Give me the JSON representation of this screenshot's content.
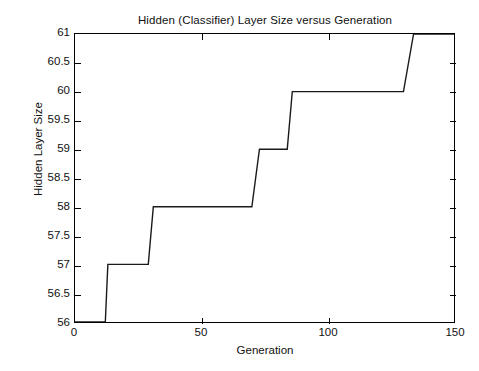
{
  "chart_data": {
    "type": "line",
    "title": "Hidden (Classifier) Layer Size versus Generation",
    "xlabel": "Generation",
    "ylabel": "Hidden Layer Size",
    "xlim": [
      0,
      150
    ],
    "ylim": [
      56,
      61
    ],
    "grid": false,
    "legend": null,
    "style": "step-like piecewise linear, single black series, no markers",
    "xticks": [
      0,
      50,
      100,
      150
    ],
    "xtick_labels": [
      "0",
      "50",
      "100",
      "150"
    ],
    "yticks": [
      56,
      56.5,
      57,
      57.5,
      58,
      58.5,
      59,
      59.5,
      60,
      60.5,
      61
    ],
    "ytick_labels": [
      "56",
      "56.5",
      "57",
      "57.5",
      "58",
      "58.5",
      "59",
      "59.5",
      "60",
      "60.5",
      "61"
    ],
    "series": [
      {
        "name": "Hidden Layer Size",
        "color": "#1a1a1a",
        "x": [
          12,
          13,
          29,
          31,
          70,
          73,
          84,
          86,
          130,
          134,
          150
        ],
        "y": [
          56,
          57,
          57,
          58,
          58,
          59,
          59,
          60,
          60,
          61,
          61
        ]
      }
    ],
    "steps": [
      {
        "generation_range": [
          0,
          12
        ],
        "value": 56
      },
      {
        "generation_range": [
          13,
          29
        ],
        "value": 57
      },
      {
        "generation_range": [
          31,
          70
        ],
        "value": 58
      },
      {
        "generation_range": [
          73,
          84
        ],
        "value": 59
      },
      {
        "generation_range": [
          86,
          130
        ],
        "value": 60
      },
      {
        "generation_range": [
          134,
          150
        ],
        "value": 61
      }
    ]
  },
  "figure": {
    "background": "#ffffff",
    "axis_color": "#000000"
  }
}
